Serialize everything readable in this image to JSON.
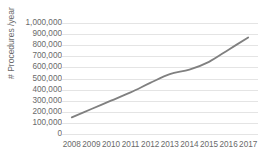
{
  "chart_data": {
    "type": "line",
    "title": "",
    "xlabel": "",
    "ylabel": "# Procedures /year",
    "categories": [
      "2008",
      "2009",
      "2010",
      "2011",
      "2012",
      "2013",
      "2014",
      "2015",
      "2016",
      "2017"
    ],
    "values": [
      150000,
      225000,
      300000,
      375000,
      460000,
      540000,
      580000,
      650000,
      760000,
      870000
    ],
    "series": [
      {
        "name": "# Procedures /year",
        "values": [
          150000,
          225000,
          300000,
          375000,
          460000,
          540000,
          580000,
          650000,
          760000,
          870000
        ]
      }
    ],
    "ylim": [
      0,
      1000000
    ],
    "ytick_values": [
      0,
      100000,
      200000,
      300000,
      400000,
      500000,
      600000,
      700000,
      800000,
      900000,
      1000000
    ],
    "ytick_labels": [
      "0",
      "100,000",
      "200,000",
      "300,000",
      "400,000",
      "500,000",
      "600,000",
      "700,000",
      "800,000",
      "900,000",
      "1,000,000"
    ],
    "grid": true,
    "legend": false,
    "legend_position": "none",
    "line_color": "#808080",
    "grid_color": "#e4e4e4",
    "text_color": "#6a6a6a",
    "smooth": true
  }
}
